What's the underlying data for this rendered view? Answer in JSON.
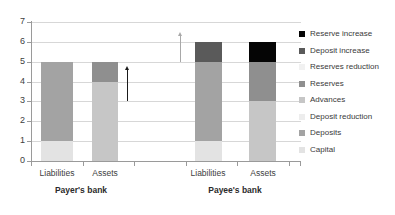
{
  "chart_data": {
    "type": "bar",
    "stacked": true,
    "title": "",
    "xlabel": "",
    "ylabel": "",
    "ylim": [
      0,
      7
    ],
    "yticks": [
      "0",
      "1",
      "2",
      "3",
      "4",
      "5",
      "6",
      "7"
    ],
    "grid": true,
    "legend_position": "right",
    "groups": [
      {
        "label": "Payer's bank",
        "categories": [
          "Liabilities",
          "Assets"
        ]
      },
      {
        "label": "Payee's bank",
        "categories": [
          "Liabilities",
          "Assets"
        ]
      }
    ],
    "categories": [
      "Liabilities",
      "Assets",
      "Liabilities",
      "Assets"
    ],
    "series": [
      {
        "name": "Capital",
        "color": "#e3e3e3",
        "values": [
          1,
          0,
          1,
          0
        ]
      },
      {
        "name": "Deposits",
        "color": "#a3a3a3",
        "values": [
          4,
          0,
          4,
          0
        ]
      },
      {
        "name": "Deposit reduction",
        "color": "#ededed",
        "values": [
          0,
          0,
          0,
          0
        ]
      },
      {
        "name": "Advances",
        "color": "#c6c6c6",
        "values": [
          0,
          4,
          0,
          3
        ]
      },
      {
        "name": "Reserves",
        "color": "#8f8f8f",
        "values": [
          0,
          1,
          0,
          2
        ]
      },
      {
        "name": "Reserves reduction",
        "color": "#f1f1f1",
        "values": [
          0,
          0,
          0,
          0
        ]
      },
      {
        "name": "Deposit increase",
        "color": "#5a5a5a",
        "values": [
          0,
          0,
          1,
          0
        ]
      },
      {
        "name": "Reserve increase",
        "color": "#050505",
        "values": [
          0,
          0,
          0,
          1
        ]
      }
    ],
    "bars": [
      {
        "group": "Payer's bank",
        "category": "Liabilities",
        "total": 5,
        "segments": [
          {
            "name": "Capital",
            "value": 1,
            "from": 0,
            "to": 1,
            "color": "#e3e3e3"
          },
          {
            "name": "Deposits",
            "value": 4,
            "from": 1,
            "to": 5,
            "color": "#a3a3a3"
          }
        ]
      },
      {
        "group": "Payer's bank",
        "category": "Assets",
        "total": 5,
        "segments": [
          {
            "name": "Advances",
            "value": 4,
            "from": 0,
            "to": 4,
            "color": "#c6c6c6"
          },
          {
            "name": "Reserves",
            "value": 1,
            "from": 4,
            "to": 5,
            "color": "#8f8f8f"
          }
        ]
      },
      {
        "group": "Payee's bank",
        "category": "Liabilities",
        "total": 6,
        "segments": [
          {
            "name": "Capital",
            "value": 1,
            "from": 0,
            "to": 1,
            "color": "#e3e3e3"
          },
          {
            "name": "Deposits",
            "value": 4,
            "from": 1,
            "to": 5,
            "color": "#a3a3a3"
          },
          {
            "name": "Deposit increase",
            "value": 1,
            "from": 5,
            "to": 6,
            "color": "#5a5a5a"
          }
        ]
      },
      {
        "group": "Payee's bank",
        "category": "Assets",
        "total": 6,
        "segments": [
          {
            "name": "Advances",
            "value": 3,
            "from": 0,
            "to": 3,
            "color": "#c6c6c6"
          },
          {
            "name": "Reserves",
            "value": 2,
            "from": 3,
            "to": 5,
            "color": "#8f8f8f"
          },
          {
            "name": "Reserve increase",
            "value": 1,
            "from": 5,
            "to": 6,
            "color": "#050505"
          }
        ]
      }
    ],
    "annotations": [
      {
        "kind": "up-arrow",
        "color": "#1a1a1a",
        "from": 3.0,
        "to": 4.8,
        "near": "Payer's bank Assets"
      },
      {
        "kind": "up-arrow",
        "color": "#a8a8a8",
        "from": 5.0,
        "to": 6.5,
        "near": "Payee's bank Liabilities"
      }
    ],
    "legend": [
      {
        "label": "Reserve increase",
        "color": "#050505"
      },
      {
        "label": "Deposit increase",
        "color": "#5a5a5a"
      },
      {
        "label": "Reserves reduction",
        "color": "#f1f1f1"
      },
      {
        "label": "Reserves",
        "color": "#8f8f8f"
      },
      {
        "label": "Advances",
        "color": "#c6c6c6"
      },
      {
        "label": "Deposit reduction",
        "color": "#ededed"
      },
      {
        "label": "Deposits",
        "color": "#a3a3a3"
      },
      {
        "label": "Capital",
        "color": "#e3e3e3"
      }
    ]
  }
}
